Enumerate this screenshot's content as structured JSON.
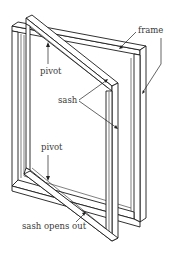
{
  "diagram": {
    "labels": {
      "frame": "frame",
      "pivot_top": "pivot",
      "sash": "sash",
      "pivot_bottom": "pivot",
      "sash_opens_out": "sash opens out"
    },
    "colors": {
      "line": "#1a1a1a",
      "text": "#3a3a3a",
      "background": "#ffffff"
    }
  }
}
